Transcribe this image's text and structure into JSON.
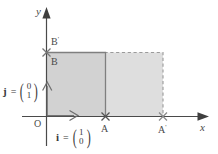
{
  "figure": {
    "background": "#ffffff",
    "width": 218,
    "height": 154
  },
  "axes": {
    "x_label": "x",
    "y_label": "y",
    "origin_label": "O",
    "axis_color": "#4a4a4a"
  },
  "points": [
    {
      "id": "A",
      "label": "A",
      "x": 105,
      "y": 116
    },
    {
      "id": "Ap",
      "label": "A",
      "prime": "'",
      "x": 163,
      "y": 116
    },
    {
      "id": "B",
      "label": "B",
      "x": 46,
      "y": 52
    },
    {
      "id": "Bp",
      "label": "B",
      "prime": "'",
      "x": 46,
      "y": 52
    }
  ],
  "labels": {
    "A": "A",
    "A_prime": "A",
    "A_prime_mark": "'",
    "B": "B",
    "B_prime": "B",
    "B_prime_mark": "'",
    "origin": "O",
    "x_axis": "x",
    "y_axis": "y"
  },
  "vectors": [
    {
      "name": "i",
      "equals": "=",
      "components": [
        "1",
        "0"
      ],
      "paren_left": "(",
      "paren_right": ")"
    },
    {
      "name": "j",
      "equals": "=",
      "components": [
        "0",
        "1"
      ],
      "paren_left": "(",
      "paren_right": ")"
    }
  ],
  "regions": [
    {
      "id": "unit-square",
      "fill": "#d2d2d2",
      "stroke": "#808080",
      "stroke_style": "solid"
    },
    {
      "id": "image-region",
      "fill": "#dedede",
      "stroke": "#a0a0a0",
      "stroke_style": "dashed"
    }
  ],
  "colors": {
    "region_dark": "#d2d2d2",
    "region_light": "#dedede",
    "axis": "#4a4a4a",
    "dashed": "#9a9a9a",
    "solid_border": "#7f7f7f",
    "text": "#4a4a4a"
  }
}
